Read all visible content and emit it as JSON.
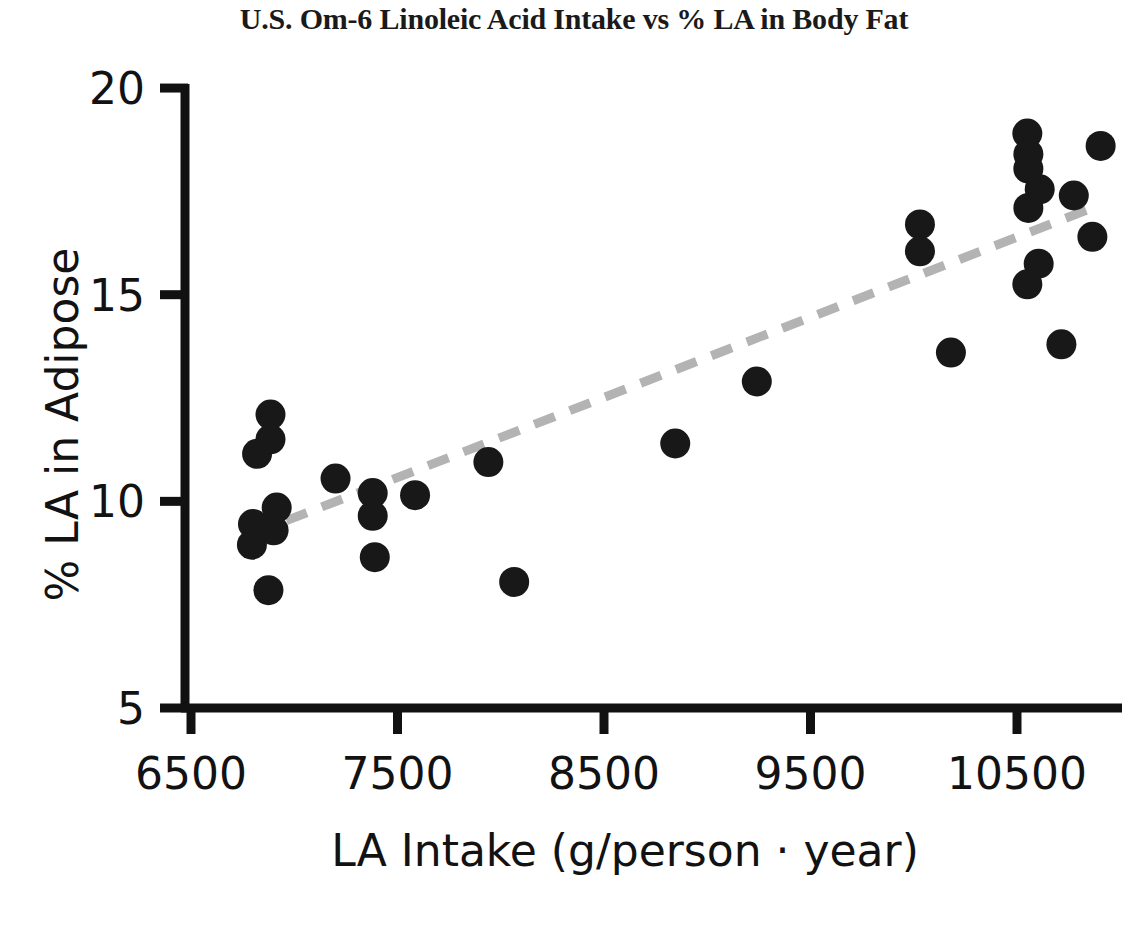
{
  "chart_data": {
    "type": "scatter",
    "title": "U.S. Om-6 Linoleic Acid Intake vs % LA in Body Fat",
    "xlabel": "LA Intake (g/person · year)",
    "ylabel": "% LA in Adipose",
    "xlim": [
      6060,
      11000
    ],
    "ylim": [
      5,
      20
    ],
    "xticks": [
      6500,
      7500,
      8500,
      9500,
      10500
    ],
    "xtick_labels": [
      "6500",
      "7500",
      "8500",
      "9500",
      "10500"
    ],
    "yticks": [
      5,
      10,
      15,
      20
    ],
    "ytick_labels": [
      "5",
      "10",
      "15",
      "20"
    ],
    "grid": false,
    "legend": null,
    "marker": {
      "shape": "circle",
      "color": "#181818",
      "size_px": 30
    },
    "points": [
      {
        "x": 6820,
        "y": 11.15
      },
      {
        "x": 6885,
        "y": 12.1
      },
      {
        "x": 6885,
        "y": 11.5
      },
      {
        "x": 6800,
        "y": 9.45
      },
      {
        "x": 6795,
        "y": 8.95
      },
      {
        "x": 6915,
        "y": 9.85
      },
      {
        "x": 6900,
        "y": 9.3
      },
      {
        "x": 6875,
        "y": 7.85
      },
      {
        "x": 7200,
        "y": 10.55
      },
      {
        "x": 7380,
        "y": 10.2
      },
      {
        "x": 7380,
        "y": 9.65
      },
      {
        "x": 7390,
        "y": 8.65
      },
      {
        "x": 7585,
        "y": 10.15
      },
      {
        "x": 7940,
        "y": 10.95
      },
      {
        "x": 8065,
        "y": 8.05
      },
      {
        "x": 8845,
        "y": 11.4
      },
      {
        "x": 9240,
        "y": 12.9
      },
      {
        "x": 10030,
        "y": 16.7
      },
      {
        "x": 10030,
        "y": 16.05
      },
      {
        "x": 10180,
        "y": 13.6
      },
      {
        "x": 10550,
        "y": 18.9
      },
      {
        "x": 10555,
        "y": 18.4
      },
      {
        "x": 10555,
        "y": 18.05
      },
      {
        "x": 10610,
        "y": 17.55
      },
      {
        "x": 10555,
        "y": 17.1
      },
      {
        "x": 10775,
        "y": 17.4
      },
      {
        "x": 10905,
        "y": 18.6
      },
      {
        "x": 10865,
        "y": 16.4
      },
      {
        "x": 10605,
        "y": 15.75
      },
      {
        "x": 10550,
        "y": 15.25
      },
      {
        "x": 10715,
        "y": 13.8
      }
    ],
    "trendline": {
      "style": "dashed",
      "color": "#b3b3b3",
      "x_start": 6790,
      "y_start": 9.2,
      "x_end": 10890,
      "y_end": 17.15
    }
  },
  "axes": {
    "y_title": "% LA in Adipose",
    "x_title": "LA Intake (g/person · year)",
    "y_labels": [
      "20",
      "15",
      "10",
      "5"
    ],
    "x_labels": [
      "6500",
      "7500",
      "8500",
      "9500",
      "10500"
    ]
  },
  "header": {
    "title": "U.S. Om-6 Linoleic Acid Intake vs % LA in Body Fat"
  }
}
